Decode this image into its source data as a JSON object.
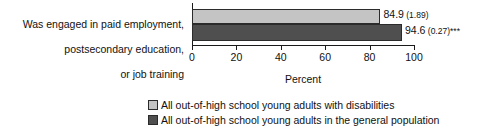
{
  "chart_data": {
    "type": "bar",
    "orientation": "horizontal",
    "title": "",
    "xlabel": "Percent",
    "ylabel": "",
    "xlim": [
      0,
      100
    ],
    "xticks": [
      0,
      20,
      40,
      60,
      80,
      100
    ],
    "grid": false,
    "legend_position": "bottom",
    "categories": [
      "Was engaged in paid employment,\npostsecondary education,\nor job training"
    ],
    "series": [
      {
        "name": "All out-of-high school young adults with disabilities",
        "color": "#c4c4c4",
        "values": [
          84.9
        ],
        "standard_errors": [
          1.89
        ],
        "significance": [
          ""
        ],
        "data_labels": [
          "84.9 (1.89)"
        ]
      },
      {
        "name": "All out-of-high school young adults in the general population",
        "color": "#4f4f4f",
        "values": [
          94.6
        ],
        "standard_errors": [
          0.27
        ],
        "significance": [
          "***"
        ],
        "data_labels": [
          "94.6 (0.27)***"
        ]
      }
    ]
  },
  "labels": {
    "category_line_1": "Was engaged in paid employment,",
    "category_line_2": "postsecondary education,",
    "category_line_3": "or job training",
    "value_light_number": "84.9",
    "value_light_se": " (1.89)",
    "value_light_stars": "",
    "value_dark_number": "94.6",
    "value_dark_se": " (0.27)",
    "value_dark_stars": "***",
    "axis_title": "Percent",
    "tick_0": "0",
    "tick_20": "20",
    "tick_40": "40",
    "tick_60": "60",
    "tick_80": "80",
    "tick_100": "100",
    "legend_1": "All out-of-high school young adults with disabilities",
    "legend_2": "All out-of-high school young adults in the general population"
  },
  "colors": {
    "light_bar": "#c4c4c4",
    "dark_bar": "#4f4f4f",
    "bar_border": "#2b2b2b",
    "axis": "#1a1a1a",
    "text": "#111111",
    "background": "#ffffff"
  }
}
